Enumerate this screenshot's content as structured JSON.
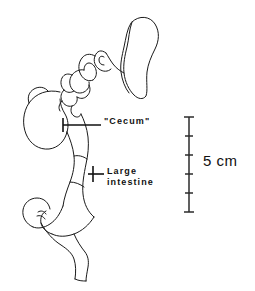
{
  "figure": {
    "kind": "anatomical-line-drawing",
    "background_color": "#ffffff",
    "line_color": "#1a1a1a",
    "width": 255,
    "height": 291
  },
  "labels": {
    "cecum": "\"Cecum\"",
    "large_intestine_line1": "Large",
    "large_intestine_line2": "intestine"
  },
  "scale_bar": {
    "value": "5 cm",
    "total_cm": 5,
    "tick_count": 4,
    "segments": 5,
    "orientation": "vertical",
    "top_y": 117,
    "bottom_y": 212,
    "x": 189,
    "color": "#2b2b2b"
  },
  "structures": {
    "stomach": "stomach",
    "small_intestine": "coiled small intestine",
    "cecum": "cecum",
    "large_intestine": "large intestine",
    "rectum": "terminal segment"
  }
}
